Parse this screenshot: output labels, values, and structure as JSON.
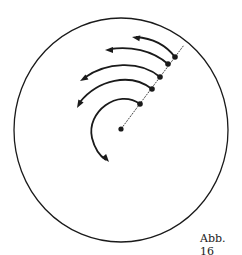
{
  "figure": {
    "caption": "Abb. 16",
    "colors": {
      "stroke": "#1a1a1a",
      "background": "#ffffff"
    },
    "outer_circle": {
      "cx": 121,
      "cy": 130,
      "rx": 107,
      "ry": 112
    },
    "center_point": {
      "x": 121,
      "y": 129
    },
    "radial_line_end": {
      "x": 184,
      "y": 45
    },
    "points": [
      {
        "x": 140,
        "y": 104
      },
      {
        "x": 152,
        "y": 89
      },
      {
        "x": 160,
        "y": 77
      },
      {
        "x": 168,
        "y": 64
      },
      {
        "x": 175,
        "y": 57
      }
    ],
    "arcs": [
      {
        "d": "M140,104 C118,88 86,112 92,138 C95,150 100,156 106,160",
        "tip": [
          109,
          162
        ],
        "angle": 50
      },
      {
        "d": "M152,89 C130,72 98,80 80,102",
        "tip": [
          77,
          108
        ],
        "angle": 120
      },
      {
        "d": "M160,77 C140,60 106,62 84,78",
        "tip": [
          80,
          81
        ],
        "angle": 150
      },
      {
        "d": "M168,64 C152,50 130,46 110,49",
        "tip": [
          105,
          50
        ],
        "angle": 180
      },
      {
        "d": "M175,57 C165,44 150,38 136,37",
        "tip": [
          132,
          37
        ],
        "angle": 190
      }
    ]
  }
}
